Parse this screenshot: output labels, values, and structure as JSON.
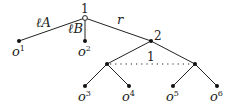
{
  "tree": {
    "root": {
      "label": "1",
      "x": 85,
      "y": 18,
      "style": "open"
    },
    "edges": [
      {
        "from": "root",
        "to": "o1",
        "label": "ℓA"
      },
      {
        "from": "root",
        "to": "o2",
        "label": "ℓB"
      },
      {
        "from": "root",
        "to": "n2",
        "label": "r"
      },
      {
        "from": "n2",
        "to": "a",
        "label": ""
      },
      {
        "from": "n2",
        "to": "b",
        "label": ""
      },
      {
        "from": "a",
        "to": "o3",
        "label": ""
      },
      {
        "from": "a",
        "to": "o4",
        "label": ""
      },
      {
        "from": "b",
        "to": "o5",
        "label": ""
      },
      {
        "from": "b",
        "to": "o6",
        "label": ""
      }
    ],
    "node2_label": "2",
    "info_set_label": "1",
    "edge_labels": {
      "lA": "ℓA",
      "lB": "ℓB",
      "r": "r"
    },
    "leaves": [
      {
        "name": "o",
        "sup": "1"
      },
      {
        "name": "o",
        "sup": "2"
      },
      {
        "name": "o",
        "sup": "3"
      },
      {
        "name": "o",
        "sup": "4"
      },
      {
        "name": "o",
        "sup": "5"
      },
      {
        "name": "o",
        "sup": "6"
      }
    ]
  }
}
